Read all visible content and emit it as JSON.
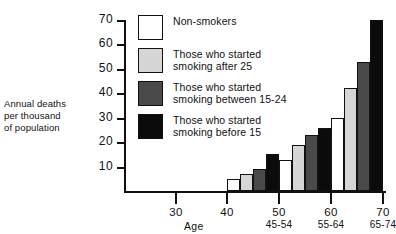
{
  "chart_data": {
    "type": "bar",
    "title": "",
    "ylabel": "Annual deaths per thousand of population",
    "xlabel": "Age",
    "ylim": [
      0,
      70
    ],
    "y_ticks": [
      10,
      20,
      30,
      40,
      50,
      60,
      70
    ],
    "x_ticks": [
      30,
      40,
      50,
      60,
      70
    ],
    "grid": false,
    "legend_position": "inside-top-left",
    "categories": [
      "45-54",
      "55-64",
      "65-74"
    ],
    "series": [
      {
        "name": "Non-smokers",
        "values": [
          5,
          12.5,
          30
        ]
      },
      {
        "name": "Those who started smoking after 25",
        "values": [
          7,
          19,
          42
        ]
      },
      {
        "name": "Those who started smoking between 15-24",
        "values": [
          9,
          23,
          53
        ]
      },
      {
        "name": "Those who started smoking before 15",
        "values": [
          15,
          26,
          70
        ]
      }
    ]
  },
  "axes": {
    "y_title_lines": [
      "Annual deaths",
      "per thousand",
      "of population"
    ],
    "y_tick_labels": [
      "10",
      "20",
      "30",
      "40",
      "50",
      "60",
      "70"
    ],
    "x_tick_labels": [
      "30",
      "40",
      "50",
      "60",
      "70"
    ],
    "x_sub_labels": [
      "45-54",
      "55-64",
      "65-74"
    ],
    "x_axis_title": "Age"
  },
  "legend": {
    "items": [
      {
        "swatch": "white",
        "line1": "Non-smokers",
        "line2": ""
      },
      {
        "swatch": "light-gray",
        "line1": "Those who started",
        "line2": "smoking after 25"
      },
      {
        "swatch": "dark-gray",
        "line1": "Those who started",
        "line2": "smoking between 15-24"
      },
      {
        "swatch": "black",
        "line1": "Those who started",
        "line2": "smoking before 15"
      }
    ]
  },
  "colors": {
    "non_smokers": "#ffffff",
    "after_25": "#d6d6d6",
    "between_15_24": "#4a4a4a",
    "before_15": "#0b0b0b",
    "ink": "#111111",
    "background": "#ffffff"
  }
}
